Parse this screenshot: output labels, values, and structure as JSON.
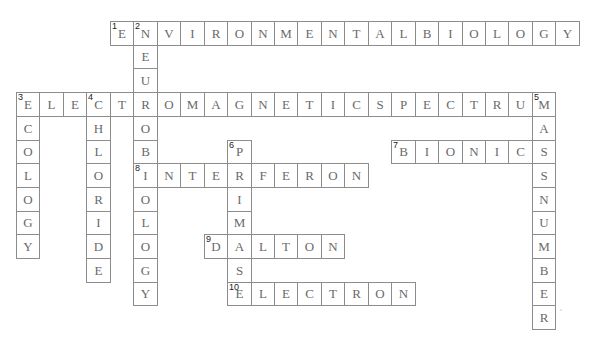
{
  "puzzle": {
    "grid": {
      "origin_x": 16,
      "origin_y": 21,
      "cell_w": 23.45,
      "cell_h": 23.7
    },
    "entries": [
      {
        "number": 1,
        "direction": "across",
        "answer": "ENVIRONMENTALBIOLOGY",
        "row": 0,
        "col": 4
      },
      {
        "number": 2,
        "direction": "down",
        "answer": "NEUROBIOLOGY",
        "row": 0,
        "col": 5
      },
      {
        "number": 3,
        "direction": "across",
        "answer": "ELECTROMAGNETICSPECTRUM",
        "row": 3,
        "col": 0
      },
      {
        "number": 3,
        "direction": "down",
        "answer": "ECOLOGY",
        "row": 3,
        "col": 0
      },
      {
        "number": 4,
        "direction": "down",
        "answer": "CHLORIDE",
        "row": 3,
        "col": 3
      },
      {
        "number": 5,
        "direction": "down",
        "answer": "MASSNUMBER",
        "row": 3,
        "col": 22
      },
      {
        "number": 6,
        "direction": "down",
        "answer": "PRIMASE",
        "row": 5,
        "col": 9
      },
      {
        "number": 7,
        "direction": "across",
        "answer": "BIONIC",
        "row": 5,
        "col": 16
      },
      {
        "number": 8,
        "direction": "across",
        "answer": "INTERFERON",
        "row": 6,
        "col": 5
      },
      {
        "number": 9,
        "direction": "across",
        "answer": "DALTON",
        "row": 9,
        "col": 8
      },
      {
        "number": 10,
        "direction": "across",
        "answer": "ELECTRON",
        "row": 11,
        "col": 9
      }
    ]
  }
}
